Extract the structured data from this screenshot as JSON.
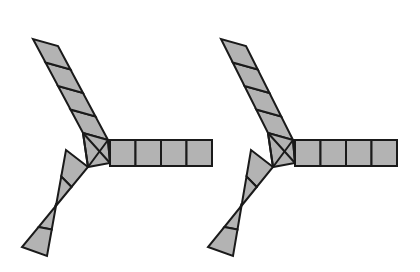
{
  "page": {
    "background_color": "#ffffff",
    "width": 420,
    "height": 272
  },
  "style": {
    "fill_color": "#b3b3b3",
    "stroke_color": "#1a1a1a",
    "stroke_width": 2.0,
    "hub_stroke_width": 2.0
  },
  "figures": [
    {
      "id": "figure-left",
      "label": "left-figure",
      "hub": {
        "center_x": 92,
        "center_y": 148,
        "polygon": [
          [
            83,
            133
          ],
          [
            108,
            140
          ],
          [
            110,
            163
          ],
          [
            88,
            167
          ]
        ],
        "diagonals": [
          [
            [
              83,
              133
            ],
            [
              110,
              163
            ]
          ],
          [
            [
              108,
              140
            ],
            [
              88,
              167
            ]
          ],
          [
            [
              83,
              133
            ],
            [
              88,
              167
            ]
          ],
          [
            [
              108,
              140
            ],
            [
              110,
              163
            ]
          ]
        ]
      },
      "arms": [
        {
          "id": "arm-upper-left",
          "label": "upper-left-arm",
          "segments": 4,
          "angle_deg": 232,
          "cell_size": 26,
          "base_a": [
            83,
            133
          ],
          "base_b": [
            108,
            140
          ],
          "tip_a": [
            33,
            39
          ],
          "tip_b": [
            58,
            46
          ]
        },
        {
          "id": "arm-lower-left",
          "label": "lower-left-arm",
          "segments": 4,
          "angle_deg": 118,
          "cell_size": 26,
          "base_a": [
            88,
            167
          ],
          "base_b": [
            66,
            150
          ],
          "tip_a": [
            22,
            247
          ],
          "tip_b": [
            47,
            256
          ]
        },
        {
          "id": "arm-right",
          "label": "right-horizontal-arm",
          "segments": 4,
          "angle_deg": 0,
          "cell_size": 26,
          "base_a": [
            110,
            140
          ],
          "base_b": [
            110,
            166
          ],
          "tip_a": [
            212,
            140
          ],
          "tip_b": [
            212,
            166
          ]
        }
      ]
    },
    {
      "id": "figure-right",
      "label": "right-figure",
      "hub": {
        "center_x": 277,
        "center_y": 148,
        "polygon": [
          [
            268,
            133
          ],
          [
            293,
            140
          ],
          [
            295,
            163
          ],
          [
            273,
            167
          ]
        ],
        "diagonals": [
          [
            [
              268,
              133
            ],
            [
              295,
              163
            ]
          ],
          [
            [
              293,
              140
            ],
            [
              273,
              167
            ]
          ],
          [
            [
              268,
              133
            ],
            [
              273,
              167
            ]
          ],
          [
            [
              293,
              140
            ],
            [
              295,
              163
            ]
          ]
        ]
      },
      "arms": [
        {
          "id": "arm-upper-left",
          "label": "upper-left-arm",
          "segments": 4,
          "angle_deg": 232,
          "cell_size": 26,
          "base_a": [
            268,
            133
          ],
          "base_b": [
            293,
            140
          ],
          "tip_a": [
            221,
            39
          ],
          "tip_b": [
            246,
            46
          ]
        },
        {
          "id": "arm-lower-left",
          "label": "lower-left-arm",
          "segments": 4,
          "angle_deg": 118,
          "cell_size": 26,
          "base_a": [
            273,
            167
          ],
          "base_b": [
            251,
            150
          ],
          "tip_a": [
            208,
            247
          ],
          "tip_b": [
            233,
            256
          ]
        },
        {
          "id": "arm-right",
          "label": "right-horizontal-arm",
          "segments": 4,
          "angle_deg": 0,
          "cell_size": 26,
          "base_a": [
            295,
            140
          ],
          "base_b": [
            295,
            166
          ],
          "tip_a": [
            397,
            140
          ],
          "tip_b": [
            397,
            166
          ]
        }
      ]
    }
  ]
}
